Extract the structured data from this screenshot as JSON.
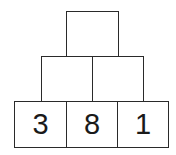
{
  "pyramid": {
    "rows": [
      {
        "row": "top",
        "cells": [
          ""
        ]
      },
      {
        "row": "middle",
        "cells": [
          "",
          ""
        ]
      },
      {
        "row": "bottom",
        "cells": [
          "3",
          "8",
          "1"
        ]
      }
    ]
  }
}
